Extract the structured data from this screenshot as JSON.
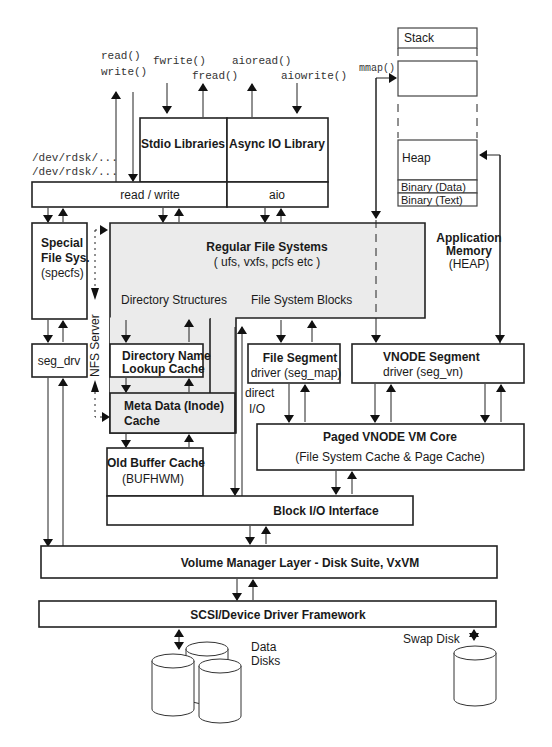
{
  "syscalls": {
    "read": "read()",
    "write": "write()",
    "fwrite": "fwrite()",
    "fread": "fread()",
    "aioread": "aioread()",
    "aiowrite": "aiowrite()",
    "mmap": "mmap()",
    "rdsk1": "/dev/rdsk/...",
    "rdsk2": "/dev/rdsk/..."
  },
  "libraries": {
    "stdio": "Stdio Libraries",
    "async_io": "Async IO Library",
    "read_write": "read / write",
    "aio": "aio"
  },
  "memory": {
    "stack": "Stack",
    "heap": "Heap",
    "binary_data": "Binary (Data)",
    "binary_text": "Binary (Text)",
    "app_memory_title_1": "Application",
    "app_memory_title_2": "Memory",
    "app_memory_sub": "(HEAP)"
  },
  "specfs": {
    "title_1": "Special",
    "title_2": "File Sys.",
    "sub": "(specfs)"
  },
  "regular_fs": {
    "title": "Regular File Systems",
    "sub": "( ufs, vxfs, pcfs etc )",
    "dir_structures": "Directory Structures",
    "fs_blocks": "File System Blocks"
  },
  "nfs_server": "NFS Server",
  "seg_drv": "seg_drv",
  "dnlc": {
    "line1": "Directory Name",
    "line2": "Lookup Cache"
  },
  "inode_cache": {
    "line1": "Meta Data (Inode)",
    "line2": "Cache"
  },
  "file_segment": {
    "title": "File Segment",
    "sub": "driver (seg_map)"
  },
  "vnode_segment": {
    "title": "VNODE Segment",
    "sub": "driver (seg_vn)"
  },
  "direct_io": {
    "line1": "direct",
    "line2": "I/O"
  },
  "paged_vm": {
    "title": "Paged VNODE VM Core",
    "sub": "(File System Cache & Page Cache)"
  },
  "buffer_cache": {
    "title": "Old Buffer Cache",
    "sub": "(BUFHWM)"
  },
  "block_io": "Block I/O Interface",
  "volume_manager": "Volume Manager Layer - Disk Suite, VxVM",
  "scsi": "SCSI/Device Driver Framework",
  "data_disks": {
    "line1": "Data",
    "line2": "Disks"
  },
  "swap_disk": "Swap Disk"
}
